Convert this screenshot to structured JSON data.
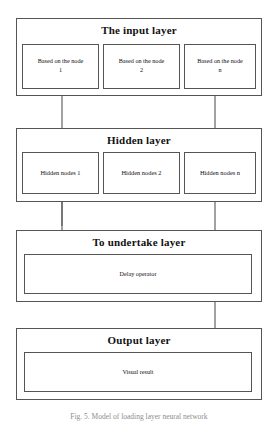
{
  "figure": {
    "caption": "Fig. 5. Model of loading layer neural network",
    "line_color": "#555555",
    "text_color": "#111111"
  },
  "layers": {
    "input": {
      "title": "The input layer",
      "nodes": [
        {
          "label": "Based on the node",
          "sub": "1"
        },
        {
          "label": "Based on the node",
          "sub": "2"
        },
        {
          "label": "Based on the node",
          "sub": "n"
        }
      ]
    },
    "hidden": {
      "title": "Hidden layer",
      "nodes": [
        {
          "label": "Hidden nodes 1"
        },
        {
          "label": "Hidden nodes 2"
        },
        {
          "label": "Hidden nodes n"
        }
      ]
    },
    "undertake": {
      "title": "To undertake layer",
      "nodes": [
        {
          "label": "Delay operator"
        }
      ]
    },
    "output": {
      "title": "Output layer",
      "nodes": [
        {
          "label": "Visual result"
        }
      ]
    }
  },
  "connectors": [
    {
      "name": "undertake-to-input-feedback",
      "direction": "up"
    },
    {
      "name": "input-to-hidden",
      "direction": "down"
    },
    {
      "name": "undertake-to-hidden-feedback",
      "direction": "up"
    },
    {
      "name": "hidden-to-undertake",
      "direction": "down"
    },
    {
      "name": "undertake-to-output",
      "direction": "down"
    }
  ]
}
